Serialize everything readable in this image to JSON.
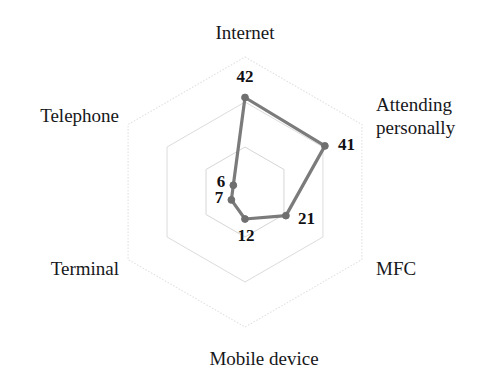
{
  "chart_data": {
    "type": "radar",
    "title": "",
    "categories": [
      "Internet",
      "Attending personally",
      "MFC",
      "Mobile device",
      "Terminal",
      "Telephone"
    ],
    "values": [
      42,
      41,
      21,
      12,
      7,
      6
    ],
    "data_labels": [
      "42",
      "41",
      "21",
      "12",
      "7",
      "6"
    ],
    "series": [
      {
        "name": "",
        "values": [
          42,
          41,
          21,
          12,
          7,
          6
        ],
        "color": "#7b7b7b"
      }
    ],
    "rings": 3,
    "ring_values": [
      20,
      40,
      60
    ],
    "rmax": 60,
    "rmin": 0,
    "grid": true,
    "grid_color": "#d9d9d9",
    "legend": "none",
    "xlabel": "",
    "ylabel": "",
    "tick_labels_shown": false
  },
  "axes": [
    {
      "key": "internet",
      "label": "Internet",
      "value": 42,
      "value_label": "42",
      "angle_deg": -90
    },
    {
      "key": "attending-personally",
      "label": "Attending personally",
      "label_line1": "Attending",
      "label_line2": "personally",
      "value": 41,
      "value_label": "41",
      "angle_deg": -30
    },
    {
      "key": "mfc",
      "label": "MFC",
      "value": 21,
      "value_label": "21",
      "angle_deg": 30
    },
    {
      "key": "mobile-device",
      "label": "Mobile device",
      "value": 12,
      "value_label": "12",
      "angle_deg": 90
    },
    {
      "key": "terminal",
      "label": "Terminal",
      "value": 7,
      "value_label": "7",
      "angle_deg": 150
    },
    {
      "key": "telephone",
      "label": "Telephone",
      "value": 6,
      "value_label": "6",
      "angle_deg": 210
    }
  ],
  "colors": {
    "series": "#7b7b7b",
    "marker": "#6f6f6f",
    "grid": "#d9d9d9",
    "text": "#17171a",
    "background": "#ffffff"
  }
}
